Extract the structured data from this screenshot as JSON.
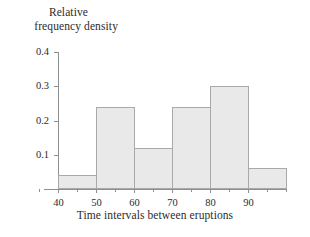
{
  "chart_data": {
    "type": "bar",
    "title": "",
    "subtitle": "",
    "xlabel": "Time intervals between eruptions",
    "ylabel": "Relative frequency density",
    "ylabel_lines": [
      "Relative",
      "frequency density"
    ],
    "categories": [
      "40-50",
      "50-60",
      "60-70",
      "70-80",
      "80-90",
      "90-100"
    ],
    "bin_edges": [
      40,
      50,
      60,
      70,
      80,
      90,
      100
    ],
    "values": [
      0.04,
      0.24,
      0.12,
      0.24,
      0.3,
      0.06
    ],
    "xlim": [
      34,
      100
    ],
    "ylim": [
      0,
      0.4
    ],
    "xticks": [
      40,
      50,
      60,
      70,
      80,
      90
    ],
    "xtick_labels": [
      "40",
      "50",
      "60",
      "70",
      "80",
      "90"
    ],
    "xticks_minor": [
      35,
      45,
      55,
      65,
      75,
      85,
      95,
      100
    ],
    "yticks": [
      0.1,
      0.2,
      0.3,
      0.4
    ],
    "ytick_labels": [
      "0.1",
      "0.2",
      "0.3",
      "0.4"
    ],
    "grid": false,
    "legend": false,
    "bar_fill_color": "#e9e9e9",
    "bar_edge_color": "#a9a9a9",
    "axis_color": "#8f8f8f",
    "text_color": "#2b2b2b"
  }
}
